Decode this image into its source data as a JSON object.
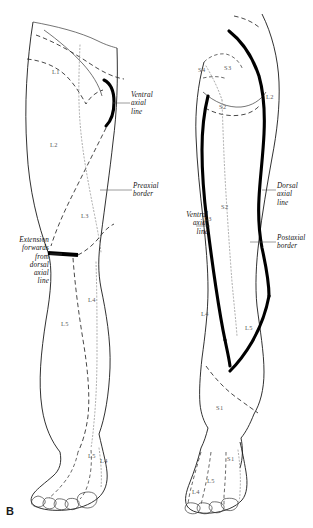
{
  "figure": {
    "panel_label": "B"
  },
  "left_figure": {
    "name": "anterior-leg-view",
    "annotations": [
      {
        "id": "ventral-axial-line",
        "text": "Ventral\naxial\nline",
        "align": "left"
      },
      {
        "id": "preaxial-border",
        "text": "Preaxial\nborder",
        "align": "left"
      },
      {
        "id": "extension-forwards",
        "text": "Extension\nforwards\nfrom\ndorsal\naxial\nline",
        "align": "right"
      }
    ],
    "dermatomes": [
      {
        "label": "L1"
      },
      {
        "label": "L2"
      },
      {
        "label": "L3"
      },
      {
        "label": "L4"
      },
      {
        "label": "L5"
      },
      {
        "label": "L5"
      },
      {
        "label": "L4"
      }
    ]
  },
  "right_figure": {
    "name": "posterior-leg-view",
    "annotations": [
      {
        "id": "dorsal-axial-line",
        "text": "Dorsal\naxial\nline",
        "align": "left"
      },
      {
        "id": "postaxial-border",
        "text": "Postaxial\nborder",
        "align": "left"
      },
      {
        "id": "ventral-axial-line",
        "text": "Ventral\naxial\nline",
        "align": "right"
      }
    ],
    "dermatomes": [
      {
        "label": "S4"
      },
      {
        "label": "S3"
      },
      {
        "label": "S2"
      },
      {
        "label": "L2"
      },
      {
        "label": "L3"
      },
      {
        "label": "S2"
      },
      {
        "label": "L4"
      },
      {
        "label": "L5"
      },
      {
        "label": "S1"
      },
      {
        "label": "S1"
      },
      {
        "label": "L5"
      },
      {
        "label": "L4"
      }
    ]
  },
  "colors": {
    "ink": "#1a1a1a",
    "axial_line": "#000000",
    "dermatome_text": "#5a5a5a",
    "background": "#ffffff"
  }
}
